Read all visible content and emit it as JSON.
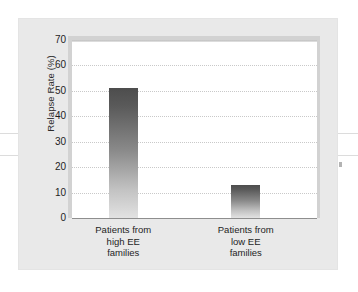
{
  "chart_data": {
    "type": "bar",
    "title": "",
    "subtitle": "",
    "xlabel": "",
    "ylabel": "Relapse Rate (%)",
    "categories": [
      "Patients from high EE families",
      "Patients from low EE families"
    ],
    "category_lines": [
      [
        "Patients from",
        "high EE",
        "families"
      ],
      [
        "Patients from",
        "low EE",
        "families"
      ]
    ],
    "values": [
      51,
      13
    ],
    "ylim": [
      0,
      70
    ],
    "ytick_values": [
      0,
      10,
      20,
      30,
      40,
      50,
      60,
      70
    ],
    "ytick_labels": [
      "0",
      "10",
      "20",
      "30",
      "40",
      "50",
      "60",
      "70"
    ],
    "grid": true,
    "grid_style": "dotted",
    "legend": null,
    "bar_fill": "gradient-gray",
    "bar_color_top": "#4d4d4d",
    "bar_color_bottom": "#e2e2e2",
    "panel_color": "#e9e9e9",
    "plot_background": "#ffffff",
    "frame_color": "#d2d2d2",
    "axis_color": "#8e8e8e",
    "gridline_color": "#c9c9c9",
    "text_color": "#1e1e1e"
  },
  "artifacts": {
    "scan_line_color": "#dcdcdc",
    "mark_color": "#9a9a9a"
  }
}
